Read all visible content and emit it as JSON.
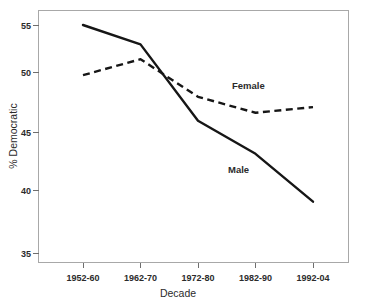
{
  "chart_data": {
    "type": "line",
    "title": "",
    "xlabel": "Decade",
    "ylabel": "% Democratic",
    "categories": [
      "1952-60",
      "1962-70",
      "1972-80",
      "1982-90",
      "1992-04"
    ],
    "series": [
      {
        "name": "Male",
        "style": "solid",
        "color": "#161616",
        "values": [
          55.0,
          53.3,
          46.6,
          43.7,
          39.5
        ],
        "label_text": "Male"
      },
      {
        "name": "Female",
        "style": "dashed",
        "color": "#161616",
        "values": [
          50.6,
          52.0,
          48.7,
          47.3,
          47.8
        ],
        "label_text": "Female"
      }
    ],
    "yticks": [
      35,
      40,
      45,
      50,
      55
    ],
    "ytick_labels": [
      "35",
      "40",
      "45",
      "50",
      "55"
    ],
    "ylim": [
      33.5,
      56.2
    ],
    "grid": false,
    "legend": "inline-annotations",
    "frame": true,
    "background": "#ffffff"
  },
  "axes": {
    "y_title": "% Democratic",
    "x_title": "Decade"
  },
  "annotations": {
    "female_label": "Female",
    "male_label": "Male"
  }
}
